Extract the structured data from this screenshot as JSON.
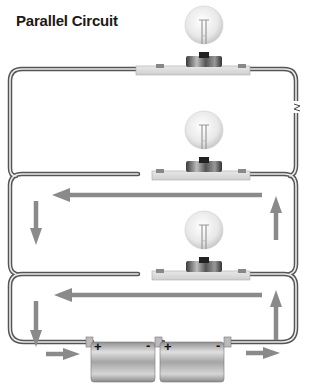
{
  "title": "Parallel Circuit",
  "colors": {
    "wire_outer": "#555555",
    "wire_inner": "#e6e6e6",
    "arrow": "#8a8a8a",
    "base_plate": "#dcdcdc",
    "bulb_glass": "#e9e9e9",
    "battery": "#b8b8b8"
  },
  "components": {
    "bulbs": [
      {
        "id": "bulb-1",
        "label": "light-bulb"
      },
      {
        "id": "bulb-2",
        "label": "light-bulb"
      },
      {
        "id": "bulb-3",
        "label": "light-bulb"
      }
    ],
    "batteries": [
      {
        "id": "battery-1",
        "positive": "+",
        "negative": "-"
      },
      {
        "id": "battery-2",
        "positive": "+",
        "negative": "-"
      }
    ]
  },
  "signs": {
    "b1_pos": "+",
    "b1_neg": "-",
    "b2_pos": "+",
    "b2_neg": "-"
  },
  "arrows": [
    {
      "loop": "middle",
      "direction": "left"
    },
    {
      "loop": "middle",
      "direction": "down"
    },
    {
      "loop": "middle",
      "direction": "up"
    },
    {
      "loop": "bottom",
      "direction": "left"
    },
    {
      "loop": "bottom",
      "direction": "down"
    },
    {
      "loop": "bottom",
      "direction": "up"
    },
    {
      "loop": "bottom",
      "direction": "right-left-side"
    },
    {
      "loop": "bottom",
      "direction": "right-right-side"
    }
  ]
}
